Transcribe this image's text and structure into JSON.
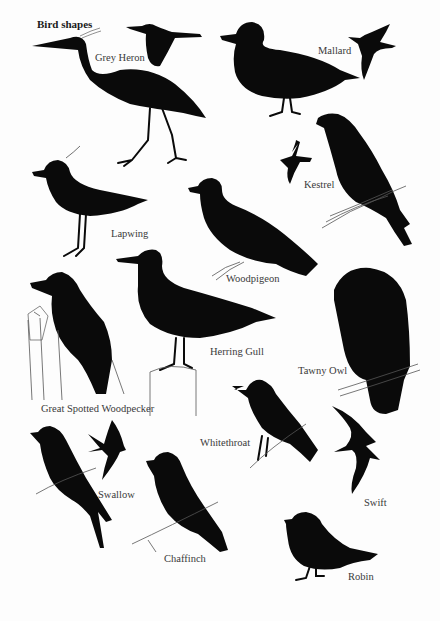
{
  "page": {
    "title": "Bird shapes",
    "birds": [
      {
        "id": "grey-heron",
        "label": "Grey Heron"
      },
      {
        "id": "mallard",
        "label": "Mallard"
      },
      {
        "id": "kestrel",
        "label": "Kestrel"
      },
      {
        "id": "lapwing",
        "label": "Lapwing"
      },
      {
        "id": "woodpigeon",
        "label": "Woodpigeon"
      },
      {
        "id": "herring-gull",
        "label": "Herring Gull"
      },
      {
        "id": "tawny-owl",
        "label": "Tawny Owl"
      },
      {
        "id": "great-spotted-woodpecker",
        "label": "Great Spotted Woodpecker"
      },
      {
        "id": "whitethroat",
        "label": "Whitethroat"
      },
      {
        "id": "swallow",
        "label": "Swallow"
      },
      {
        "id": "swift",
        "label": "Swift"
      },
      {
        "id": "chaffinch",
        "label": "Chaffinch"
      },
      {
        "id": "robin",
        "label": "Robin"
      }
    ]
  }
}
